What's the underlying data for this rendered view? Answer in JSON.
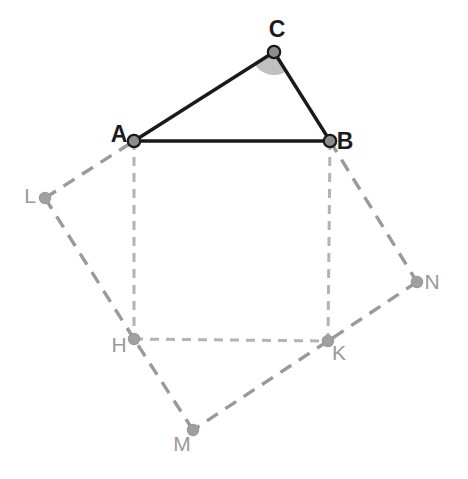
{
  "figure": {
    "canvas": {
      "width": 468,
      "height": 479,
      "background": "#ffffff"
    },
    "colors": {
      "triangle_stroke": "#1a1a1a",
      "inner_square_stroke": "#b3b3b3",
      "outer_quad_stroke": "#9a9a9a",
      "vertex_fill_dark": "#8c8c8c",
      "vertex_fill_light": "#a0a0a0",
      "vertex_stroke_dark": "#1a1a1a",
      "angle_sector_fill": "#b5b5b5",
      "label_dark": "#1c1c1c",
      "label_light": "#9a9a9a"
    },
    "points": [
      {
        "id": "A",
        "label": "A",
        "x": 134,
        "y": 141,
        "label_x": 119,
        "label_y": 136,
        "style": "dark"
      },
      {
        "id": "B",
        "label": "B",
        "x": 330,
        "y": 141,
        "label_x": 345,
        "label_y": 143,
        "style": "dark"
      },
      {
        "id": "C",
        "label": "C",
        "x": 274,
        "y": 52,
        "label_x": 277,
        "label_y": 31,
        "style": "dark"
      },
      {
        "id": "L",
        "label": "L",
        "x": 45,
        "y": 198,
        "label_x": 30,
        "label_y": 197,
        "style": "light"
      },
      {
        "id": "N",
        "label": "N",
        "x": 417,
        "y": 282,
        "label_x": 432,
        "label_y": 283,
        "style": "light"
      },
      {
        "id": "H",
        "label": "H",
        "x": 134,
        "y": 339,
        "label_x": 119,
        "label_y": 346,
        "style": "light"
      },
      {
        "id": "K",
        "label": "K",
        "x": 328,
        "y": 341,
        "label_x": 339,
        "label_y": 354,
        "style": "light"
      },
      {
        "id": "M",
        "label": "M",
        "x": 193,
        "y": 430,
        "label_x": 182,
        "label_y": 445,
        "style": "light"
      }
    ],
    "segments": [
      {
        "id": "AC",
        "from": "A",
        "to": "C",
        "kind": "solid",
        "group": "triangle"
      },
      {
        "id": "CB",
        "from": "C",
        "to": "B",
        "kind": "solid",
        "group": "triangle"
      },
      {
        "id": "AB",
        "from": "A",
        "to": "B",
        "kind": "solid",
        "group": "triangle"
      },
      {
        "id": "AH",
        "from": "A",
        "to": "H",
        "kind": "dashed-fine",
        "group": "inner-square"
      },
      {
        "id": "BK",
        "from": "B",
        "to": "K",
        "kind": "dashed-fine",
        "group": "inner-square"
      },
      {
        "id": "HK",
        "from": "H",
        "to": "K",
        "kind": "dashed-fine",
        "group": "inner-square"
      },
      {
        "id": "LA",
        "from": "L",
        "to": "A",
        "kind": "dashed-coarse",
        "group": "outer-quad"
      },
      {
        "id": "BN",
        "from": "B",
        "to": "N",
        "kind": "dashed-coarse",
        "group": "outer-quad"
      },
      {
        "id": "NK",
        "from": "N",
        "to": "K",
        "kind": "dashed-coarse",
        "group": "outer-quad"
      },
      {
        "id": "KM",
        "from": "K",
        "to": "M",
        "kind": "dashed-coarse",
        "group": "outer-quad"
      },
      {
        "id": "MH",
        "from": "M",
        "to": "H",
        "kind": "dashed-coarse",
        "group": "outer-quad"
      },
      {
        "id": "HL",
        "from": "H",
        "to": "L",
        "kind": "dashed-coarse",
        "group": "outer-quad"
      }
    ],
    "angle_marker": {
      "at": "C",
      "radius": 23,
      "ray_to_1": "A",
      "ray_to_2": "B",
      "fill": "#b5b5b5"
    }
  }
}
